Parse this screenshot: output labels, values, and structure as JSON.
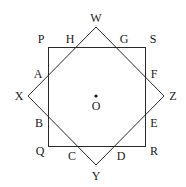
{
  "diagram": {
    "type": "geometry",
    "square": {
      "vertices": [
        "P",
        "S",
        "R",
        "Q"
      ]
    },
    "diamond": {
      "vertices": [
        "W",
        "Z",
        "Y",
        "X"
      ]
    },
    "center": "O",
    "labels": {
      "W": "W",
      "X": "X",
      "Y": "Y",
      "Z": "Z",
      "P": "P",
      "Q": "Q",
      "R": "R",
      "S": "S",
      "A": "A",
      "B": "B",
      "C": "C",
      "D": "D",
      "E": "E",
      "F": "F",
      "G": "G",
      "H": "H",
      "O": "O"
    },
    "intersections": [
      "A",
      "B",
      "C",
      "D",
      "E",
      "F",
      "G",
      "H"
    ]
  }
}
